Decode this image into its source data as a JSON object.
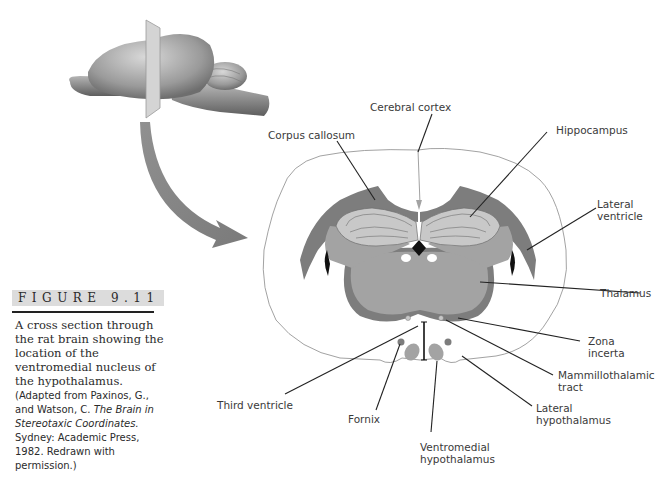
{
  "figure": {
    "number_label": "FIGURE  9.11",
    "caption_main": "A cross section through the rat brain showing the location of the ventromedial nucleus of the hypothalamus.",
    "caption_source_1": " (Adapted from Paxinos, G., and Watson, C. ",
    "caption_source_title": "The Brain in Stereotaxic Coordinates.",
    "caption_source_2": " Sydney: Academic Press, 1982. Redrawn with permission.)"
  },
  "labels": {
    "cerebral_cortex": "Cerebral cortex",
    "corpus_callosum": "Corpus callosum",
    "hippocampus": "Hippocampus",
    "lateral_ventricle_1": "Lateral",
    "lateral_ventricle_2": "ventricle",
    "thalamus": "Thalamus",
    "zona_incerta_1": "Zona",
    "zona_incerta_2": "incerta",
    "mammillothalamic_1": "Mammillothalamic",
    "mammillothalamic_2": "tract",
    "lateral_hypothalamus_1": "Lateral",
    "lateral_hypothalamus_2": "hypothalamus",
    "ventromedial_1": "Ventromedial",
    "ventromedial_2": "hypothalamus",
    "fornix": "Fornix",
    "third_ventricle": "Third ventricle"
  },
  "colors": {
    "dark_gray": "#7d7d7d",
    "mid_gray": "#a3a3a3",
    "light_gray": "#c8c8c8",
    "outline": "#888888",
    "arrow": "#8a8a8a"
  }
}
